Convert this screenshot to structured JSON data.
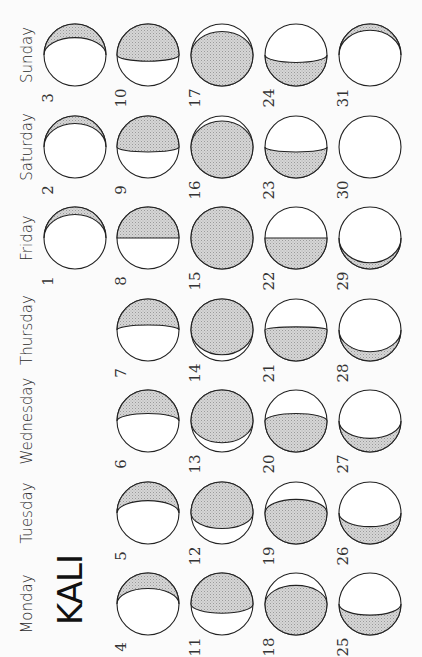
{
  "calendar": {
    "title": "KALI",
    "weekdays": [
      "Sunday",
      "Saturday",
      "Friday",
      "Thursday",
      "Wednesday",
      "Tuesday",
      "Monday"
    ],
    "orientation": "rotated-90-ccw",
    "shade_color": "#c8c8c8",
    "outline_color": "#222222",
    "days": [
      {
        "date": "1",
        "weekday": "Friday",
        "week": 0,
        "phase": "waning-thin",
        "shade": 0.12,
        "side": "top"
      },
      {
        "date": "2",
        "weekday": "Saturday",
        "week": 0,
        "phase": "waning-thin",
        "shade": 0.12,
        "side": "top"
      },
      {
        "date": "3",
        "weekday": "Sunday",
        "week": 0,
        "phase": "crescent",
        "shade": 0.22,
        "side": "top"
      },
      {
        "date": "4",
        "weekday": "Monday",
        "week": 1,
        "phase": "crescent",
        "shade": 0.25,
        "side": "top"
      },
      {
        "date": "5",
        "weekday": "Tuesday",
        "week": 1,
        "phase": "crescent",
        "shade": 0.3,
        "side": "top"
      },
      {
        "date": "6",
        "weekday": "Wednesday",
        "week": 1,
        "phase": "crescent",
        "shade": 0.38,
        "side": "top"
      },
      {
        "date": "7",
        "weekday": "Thursday",
        "week": 1,
        "phase": "crescent",
        "shade": 0.42,
        "side": "top"
      },
      {
        "date": "8",
        "weekday": "Friday",
        "week": 1,
        "phase": "quarter",
        "shade": 0.5,
        "side": "top"
      },
      {
        "date": "9",
        "weekday": "Saturday",
        "week": 1,
        "phase": "gibbous",
        "shade": 0.58,
        "side": "top"
      },
      {
        "date": "10",
        "weekday": "Sunday",
        "week": 1,
        "phase": "gibbous",
        "shade": 0.6,
        "side": "top"
      },
      {
        "date": "11",
        "weekday": "Monday",
        "week": 2,
        "phase": "gibbous",
        "shade": 0.65,
        "side": "top"
      },
      {
        "date": "12",
        "weekday": "Tuesday",
        "week": 2,
        "phase": "gibbous",
        "shade": 0.75,
        "side": "top"
      },
      {
        "date": "13",
        "weekday": "Wednesday",
        "week": 2,
        "phase": "gibbous",
        "shade": 0.85,
        "side": "top"
      },
      {
        "date": "14",
        "weekday": "Thursday",
        "week": 2,
        "phase": "gibbous",
        "shade": 0.9,
        "side": "top"
      },
      {
        "date": "15",
        "weekday": "Friday",
        "week": 2,
        "phase": "full",
        "shade": 1.0,
        "side": "top"
      },
      {
        "date": "16",
        "weekday": "Saturday",
        "week": 2,
        "phase": "gibbous",
        "shade": 0.92,
        "side": "bottom"
      },
      {
        "date": "17",
        "weekday": "Sunday",
        "week": 2,
        "phase": "gibbous",
        "shade": 0.88,
        "side": "bottom"
      },
      {
        "date": "18",
        "weekday": "Monday",
        "week": 3,
        "phase": "gibbous",
        "shade": 0.8,
        "side": "bottom"
      },
      {
        "date": "19",
        "weekday": "Tuesday",
        "week": 3,
        "phase": "gibbous",
        "shade": 0.72,
        "side": "bottom"
      },
      {
        "date": "20",
        "weekday": "Wednesday",
        "week": 3,
        "phase": "gibbous",
        "shade": 0.62,
        "side": "bottom"
      },
      {
        "date": "21",
        "weekday": "Thursday",
        "week": 3,
        "phase": "gibbous",
        "shade": 0.55,
        "side": "bottom"
      },
      {
        "date": "22",
        "weekday": "Friday",
        "week": 3,
        "phase": "quarter",
        "shade": 0.5,
        "side": "bottom"
      },
      {
        "date": "23",
        "weekday": "Saturday",
        "week": 3,
        "phase": "crescent",
        "shade": 0.42,
        "side": "bottom"
      },
      {
        "date": "24",
        "weekday": "Sunday",
        "week": 3,
        "phase": "crescent",
        "shade": 0.38,
        "side": "bottom"
      },
      {
        "date": "25",
        "weekday": "Monday",
        "week": 4,
        "phase": "crescent",
        "shade": 0.32,
        "side": "bottom"
      },
      {
        "date": "26",
        "weekday": "Tuesday",
        "week": 4,
        "phase": "crescent",
        "shade": 0.28,
        "side": "bottom"
      },
      {
        "date": "27",
        "weekday": "Wednesday",
        "week": 4,
        "phase": "crescent",
        "shade": 0.22,
        "side": "bottom"
      },
      {
        "date": "28",
        "weekday": "Thursday",
        "week": 4,
        "phase": "crescent",
        "shade": 0.15,
        "side": "bottom"
      },
      {
        "date": "29",
        "weekday": "Friday",
        "week": 4,
        "phase": "crescent",
        "shade": 0.1,
        "side": "bottom"
      },
      {
        "date": "30",
        "weekday": "Saturday",
        "week": 4,
        "phase": "new",
        "shade": 0.0,
        "side": "none"
      },
      {
        "date": "31",
        "weekday": "Sunday",
        "week": 4,
        "phase": "crescent",
        "shade": 0.1,
        "side": "top"
      }
    ]
  }
}
